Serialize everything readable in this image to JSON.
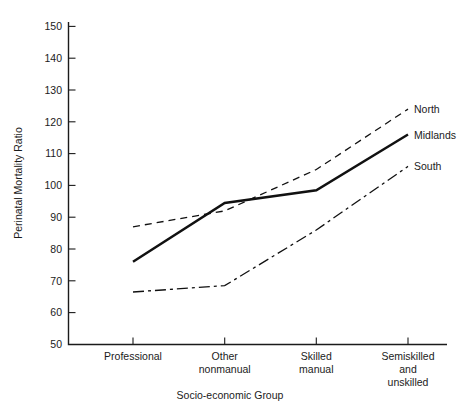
{
  "chart_data": {
    "type": "line",
    "title": "",
    "xlabel": "Socio-economic Group",
    "ylabel": "Perinatal Mortality Ratio",
    "categories": [
      "Professional",
      "Other nonmanual",
      "Skilled manual",
      "Semiskilled and unskilled"
    ],
    "category_lines": [
      [
        "Professional"
      ],
      [
        "Other",
        "nonmanual"
      ],
      [
        "Skilled",
        "manual"
      ],
      [
        "Semiskilled",
        "and",
        "unskilled"
      ]
    ],
    "ylim": [
      50,
      150
    ],
    "yticks": [
      50,
      60,
      70,
      80,
      90,
      100,
      110,
      120,
      130,
      140,
      150
    ],
    "ytick_labels": [
      "50",
      "60",
      "70",
      "80",
      "90",
      "100",
      "110",
      "120",
      "130",
      "140",
      "150"
    ],
    "grid": false,
    "legend_position": "right-inline-labels",
    "series": [
      {
        "name": "North",
        "label": "North",
        "style": "dashed",
        "color": "#111111",
        "values": [
          87,
          92,
          105,
          124
        ]
      },
      {
        "name": "Midlands",
        "label": "Midlands",
        "style": "solid",
        "color": "#111111",
        "values": [
          76,
          94.5,
          98.5,
          116
        ]
      },
      {
        "name": "South",
        "label": "South",
        "style": "dash-dot",
        "color": "#111111",
        "values": [
          66.5,
          68.5,
          86,
          106
        ]
      }
    ]
  },
  "axes": {
    "y_axis_title": "Perinatal Mortality Ratio",
    "x_axis_title": "Socio-economic Group"
  },
  "series_labels": {
    "north": "North",
    "midlands": "Midlands",
    "south": "South"
  }
}
